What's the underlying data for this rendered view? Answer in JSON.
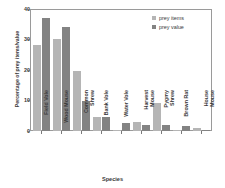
{
  "chart_data": {
    "type": "bar",
    "title": "",
    "xlabel": "Species",
    "ylabel": "Percentage of prey items/value",
    "ylim": [
      0,
      40
    ],
    "yticks": [
      0,
      10,
      20,
      30,
      40
    ],
    "grid": false,
    "legend_position": "top-right",
    "categories": [
      "Field Vole",
      "Wood Mouse",
      "Common Shrew",
      "Bank Vole",
      "Water Vole",
      "Harvest Mouse",
      "Pygmy Shrew",
      "Brown Rat",
      "House Mouse"
    ],
    "series": [
      {
        "name": "prey items",
        "color": "#b5b5b5",
        "values": [
          28.3,
          30.5,
          20.0,
          4.7,
          0.3,
          2.9,
          9.4,
          0.3,
          0.9
        ]
      },
      {
        "name": "prey value",
        "color": "#838383",
        "values": [
          37.3,
          34.5,
          9.9,
          4.7,
          2.7,
          2.1,
          2.1,
          1.7,
          0.2
        ]
      }
    ]
  },
  "axes": {
    "y_title": "Percentage of prey items/value",
    "x_title": "Species",
    "y_tick_labels": [
      "40",
      "30",
      "20",
      "10",
      "0"
    ]
  },
  "legend": {
    "items": [
      {
        "label": "prey items",
        "color": "#b5b5b5"
      },
      {
        "label": "prey value",
        "color": "#838383"
      }
    ]
  },
  "colors": {
    "prey_items": "#b5b5b5",
    "prey_value": "#838383",
    "axis": "#9a9a9a",
    "text": "#3a3a3a",
    "background": "#ffffff"
  }
}
